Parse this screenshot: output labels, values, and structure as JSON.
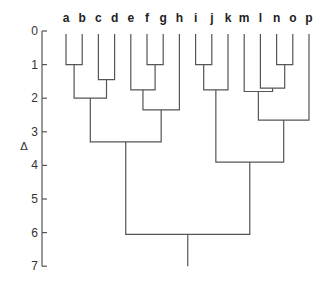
{
  "chart_data": {
    "type": "dendrogram",
    "title": "",
    "ylabel": "Δ",
    "ylim": [
      0,
      7
    ],
    "y_ticks": [
      0,
      1,
      2,
      3,
      4,
      5,
      6,
      7
    ],
    "leaves": [
      "a",
      "b",
      "c",
      "d",
      "e",
      "f",
      "g",
      "h",
      "i",
      "j",
      "k",
      "m",
      "l",
      "n",
      "o",
      "p"
    ],
    "merges": [
      {
        "id": "ab",
        "children": [
          "a",
          "b"
        ],
        "height": 1.0
      },
      {
        "id": "cd",
        "children": [
          "c",
          "d"
        ],
        "height": 1.45
      },
      {
        "id": "abcd",
        "children": [
          "ab",
          "cd"
        ],
        "height": 2.0
      },
      {
        "id": "fg",
        "children": [
          "f",
          "g"
        ],
        "height": 1.0
      },
      {
        "id": "efg",
        "children": [
          "e",
          "fg"
        ],
        "height": 1.75
      },
      {
        "id": "efgh",
        "children": [
          "efg",
          "h"
        ],
        "height": 2.35
      },
      {
        "id": "a-h",
        "children": [
          "abcd",
          "efgh"
        ],
        "height": 3.3
      },
      {
        "id": "ij",
        "children": [
          "i",
          "j"
        ],
        "height": 1.0
      },
      {
        "id": "ijk",
        "children": [
          "ij",
          "k"
        ],
        "height": 1.75
      },
      {
        "id": "no",
        "children": [
          "n",
          "o"
        ],
        "height": 1.0
      },
      {
        "id": "lno",
        "children": [
          "l",
          "no"
        ],
        "height": 1.7
      },
      {
        "id": "mlno",
        "children": [
          "m",
          "lno"
        ],
        "height": 1.8
      },
      {
        "id": "mlnop",
        "children": [
          "mlno",
          "p"
        ],
        "height": 2.65
      },
      {
        "id": "i-p",
        "children": [
          "ijk",
          "mlnop"
        ],
        "height": 3.9
      },
      {
        "id": "root",
        "children": [
          "a-h",
          "i-p"
        ],
        "height": 6.05
      }
    ],
    "root_stem_to": 7
  },
  "colors": {
    "line": "#555555",
    "text": "#222222",
    "background": "#ffffff"
  }
}
